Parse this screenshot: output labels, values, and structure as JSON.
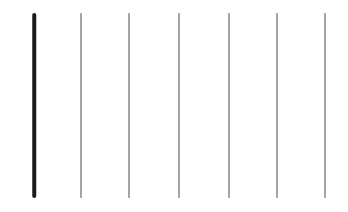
{
  "figure": {
    "width": 348,
    "height": 212,
    "background_color": "#ffffff",
    "title": "",
    "subtitle": ""
  },
  "chart_data": {
    "type": "line",
    "title": "",
    "xlabel": "",
    "ylabel": "",
    "grid": false,
    "legend_position": "none",
    "xlim": [
      0,
      348
    ],
    "ylim": [
      0,
      212
    ],
    "orientation": "vertical",
    "categories": [
      "1",
      "2",
      "3",
      "4",
      "5",
      "6",
      "7"
    ],
    "values": [
      185,
      185,
      185,
      185,
      185,
      185,
      185
    ],
    "series": [
      {
        "name": "vertical-lines",
        "values": [
          185,
          185,
          185,
          185,
          185,
          185,
          185
        ]
      }
    ],
    "x": [
      34,
      81,
      129,
      179,
      229,
      277,
      325
    ],
    "y_top": 13,
    "y_bottom": 198,
    "lines": [
      {
        "index": 1,
        "label": "line-1",
        "x": 34,
        "y_top": 13,
        "y_bottom": 198,
        "length": 185,
        "width": 3.5,
        "color": "#1a1a1a",
        "emphasis": "bold"
      },
      {
        "index": 2,
        "label": "line-2",
        "x": 81,
        "y_top": 13,
        "y_bottom": 198,
        "length": 185,
        "width": 1,
        "color": "#4d4d4d",
        "emphasis": "normal"
      },
      {
        "index": 3,
        "label": "line-3",
        "x": 129,
        "y_top": 13,
        "y_bottom": 198,
        "length": 185,
        "width": 1,
        "color": "#4d4d4d",
        "emphasis": "normal"
      },
      {
        "index": 4,
        "label": "line-4",
        "x": 179,
        "y_top": 13,
        "y_bottom": 198,
        "length": 185,
        "width": 1,
        "color": "#4d4d4d",
        "emphasis": "normal"
      },
      {
        "index": 5,
        "label": "line-5",
        "x": 229,
        "y_top": 13,
        "y_bottom": 198,
        "length": 185,
        "width": 1,
        "color": "#4d4d4d",
        "emphasis": "normal"
      },
      {
        "index": 6,
        "label": "line-6",
        "x": 277,
        "y_top": 13,
        "y_bottom": 198,
        "length": 185,
        "width": 1,
        "color": "#4d4d4d",
        "emphasis": "normal"
      },
      {
        "index": 7,
        "label": "line-7",
        "x": 325,
        "y_top": 13,
        "y_bottom": 198,
        "length": 185,
        "width": 1,
        "color": "#4d4d4d",
        "emphasis": "normal"
      }
    ]
  }
}
